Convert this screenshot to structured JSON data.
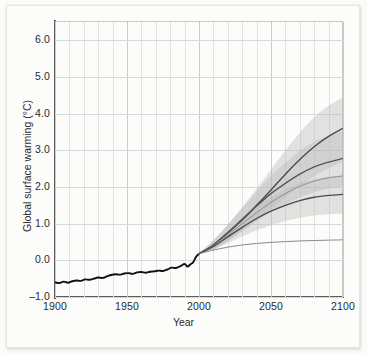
{
  "chart_data": {
    "type": "line",
    "title": "",
    "xlabel": "Year",
    "ylabel": "Global surface warming (°C)",
    "xlim": [
      1900,
      2100
    ],
    "ylim": [
      -1.0,
      6.5
    ],
    "grid": true,
    "legend_position": "none",
    "x_ticks": [
      1900,
      1950,
      2000,
      2050,
      2100
    ],
    "x_tick_labels": [
      "1900",
      "1950",
      "2000",
      "2050",
      "2100"
    ],
    "x_minor_tick_step": 10,
    "y_ticks": [
      -1.0,
      0.0,
      1.0,
      2.0,
      3.0,
      4.0,
      5.0,
      6.0
    ],
    "y_tick_labels": [
      "–1.0",
      "0.0",
      "1.0",
      "2.0",
      "3.0",
      "4.0",
      "5.0",
      "6.0"
    ],
    "series": [
      {
        "name": "historical-observations",
        "color": "#111111",
        "style": "solid-thick",
        "x": [
          1900,
          1903,
          1906,
          1909,
          1912,
          1915,
          1918,
          1921,
          1924,
          1927,
          1930,
          1933,
          1936,
          1939,
          1942,
          1945,
          1948,
          1951,
          1954,
          1957,
          1960,
          1963,
          1966,
          1969,
          1972,
          1975,
          1978,
          1981,
          1984,
          1987,
          1990,
          1992,
          1994,
          1996,
          1998,
          2000
        ],
        "values": [
          -0.6,
          -0.62,
          -0.58,
          -0.61,
          -0.57,
          -0.55,
          -0.56,
          -0.52,
          -0.53,
          -0.5,
          -0.47,
          -0.48,
          -0.44,
          -0.4,
          -0.38,
          -0.39,
          -0.36,
          -0.35,
          -0.37,
          -0.33,
          -0.32,
          -0.34,
          -0.31,
          -0.3,
          -0.28,
          -0.29,
          -0.25,
          -0.2,
          -0.21,
          -0.16,
          -0.1,
          -0.17,
          -0.11,
          -0.05,
          0.1,
          0.18
        ]
      },
      {
        "name": "scenario-a2",
        "color": "#4a4a4a",
        "style": "solid",
        "x": [
          2000,
          2010,
          2020,
          2030,
          2040,
          2050,
          2060,
          2070,
          2080,
          2090,
          2100
        ],
        "values": [
          0.18,
          0.42,
          0.75,
          1.1,
          1.5,
          1.92,
          2.35,
          2.75,
          3.1,
          3.38,
          3.6
        ],
        "band_low": [
          0.18,
          0.28,
          0.52,
          0.78,
          1.08,
          1.4,
          1.72,
          2.02,
          2.3,
          2.52,
          2.7
        ],
        "band_high": [
          0.18,
          0.56,
          0.98,
          1.45,
          1.95,
          2.48,
          3.0,
          3.48,
          3.9,
          4.22,
          4.45
        ]
      },
      {
        "name": "scenario-a1b",
        "color": "#555555",
        "style": "solid",
        "x": [
          2000,
          2010,
          2020,
          2030,
          2040,
          2050,
          2060,
          2070,
          2080,
          2090,
          2100
        ],
        "values": [
          0.18,
          0.42,
          0.76,
          1.12,
          1.48,
          1.82,
          2.1,
          2.35,
          2.55,
          2.68,
          2.78
        ],
        "band_low": [
          0.18,
          0.3,
          0.55,
          0.82,
          1.08,
          1.33,
          1.53,
          1.72,
          1.86,
          1.96,
          2.03
        ],
        "band_high": [
          0.18,
          0.54,
          0.97,
          1.42,
          1.88,
          2.31,
          2.67,
          2.98,
          3.24,
          3.4,
          3.53
        ]
      },
      {
        "name": "scenario-intermediate",
        "color": "#8e8e8e",
        "style": "solid-light",
        "x": [
          2000,
          2010,
          2020,
          2030,
          2040,
          2050,
          2060,
          2070,
          2080,
          2090,
          2100
        ],
        "values": [
          0.18,
          0.4,
          0.7,
          1.0,
          1.3,
          1.58,
          1.82,
          2.02,
          2.16,
          2.25,
          2.3
        ]
      },
      {
        "name": "scenario-b1",
        "color": "#4a4a4a",
        "style": "solid",
        "x": [
          2000,
          2010,
          2020,
          2030,
          2040,
          2050,
          2060,
          2070,
          2080,
          2090,
          2100
        ],
        "values": [
          0.18,
          0.38,
          0.64,
          0.9,
          1.14,
          1.34,
          1.5,
          1.63,
          1.72,
          1.77,
          1.8
        ],
        "band_low": [
          0.18,
          0.28,
          0.47,
          0.65,
          0.82,
          0.96,
          1.07,
          1.16,
          1.22,
          1.26,
          1.28
        ],
        "band_high": [
          0.18,
          0.48,
          0.81,
          1.15,
          1.46,
          1.72,
          1.93,
          2.1,
          2.22,
          2.28,
          2.32
        ]
      },
      {
        "name": "constant-composition-commitment",
        "color": "#8a8a8a",
        "style": "solid-light",
        "x": [
          2000,
          2010,
          2020,
          2030,
          2040,
          2050,
          2060,
          2070,
          2080,
          2090,
          2100
        ],
        "values": [
          0.18,
          0.28,
          0.36,
          0.42,
          0.46,
          0.49,
          0.51,
          0.53,
          0.54,
          0.55,
          0.56
        ]
      }
    ]
  },
  "axis": {
    "x_title": "Year",
    "y_title": "Global surface warming (°C)"
  },
  "colors": {
    "axis": "#5c5c5c",
    "grid_minor": "#e2e2e0",
    "grid_major": "#c9cbd0",
    "observations": "#111111",
    "band": "#b9b9b9",
    "page_background": "#fbfbfa",
    "plot_background": "#fdfdfc"
  }
}
